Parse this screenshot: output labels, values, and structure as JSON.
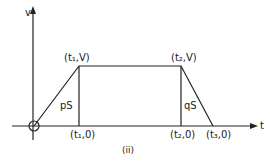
{
  "diagram": {
    "caption": "(ii)",
    "axes": {
      "y_label": "v",
      "x_label": "t"
    },
    "points": {
      "p1": "(t₁,V)",
      "p2": "(t₂,V)",
      "a1": "(t₁,0)",
      "a2": "(t₂,0)",
      "a3": "(t₃,0)"
    },
    "regions": {
      "left": "pS",
      "right": "qS"
    },
    "colors": {
      "ink": "#222222",
      "background": "#ffffff"
    }
  }
}
